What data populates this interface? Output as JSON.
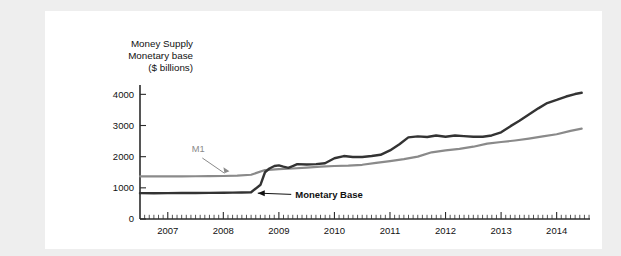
{
  "figure": {
    "background": "#ffffff",
    "page_background": "#eeeeee"
  },
  "chart_data": {
    "type": "line",
    "title": "Money Supply",
    "title_lines": [
      "Money Supply",
      "Monetary base",
      "($ billions)"
    ],
    "xlabel": "",
    "ylabel": "$ billions",
    "xlim": [
      2006.5,
      2014.6
    ],
    "ylim": [
      0,
      4300
    ],
    "yticks": [
      0,
      1000,
      2000,
      3000,
      4000
    ],
    "ytick_labels": [
      "0",
      "1000",
      "2000",
      "3000",
      "4000"
    ],
    "xticks": [
      2007,
      2008,
      2009,
      2010,
      2011,
      2012,
      2013,
      2014
    ],
    "xtick_labels": [
      "2007",
      "2008",
      "2009",
      "2010",
      "2011",
      "2012",
      "2013",
      "2014"
    ],
    "minor_tick_interval": 0.08333,
    "grid": false,
    "legend": "inline-annotations",
    "annotations": [
      {
        "text": "M1",
        "x": 2007.55,
        "y": 2150,
        "color": "#8a8a8a",
        "bold": false
      },
      {
        "text": "Monetary Base",
        "x": 2009.15,
        "y": 790,
        "color": "#111111",
        "bold": true
      }
    ],
    "series": [
      {
        "name": "M1",
        "color": "#8a8a8a",
        "width": 2.2,
        "x": [
          2006.5,
          2006.75,
          2007.0,
          2007.25,
          2007.5,
          2007.75,
          2008.0,
          2008.25,
          2008.5,
          2008.75,
          2009.0,
          2009.25,
          2009.5,
          2009.75,
          2010.0,
          2010.25,
          2010.5,
          2010.75,
          2011.0,
          2011.25,
          2011.5,
          2011.75,
          2012.0,
          2012.25,
          2012.5,
          2012.75,
          2013.0,
          2013.25,
          2013.5,
          2013.75,
          2014.0,
          2014.25,
          2014.45
        ],
        "values": [
          1370,
          1368,
          1365,
          1370,
          1372,
          1375,
          1380,
          1390,
          1420,
          1570,
          1600,
          1620,
          1650,
          1680,
          1700,
          1710,
          1740,
          1800,
          1860,
          1920,
          2000,
          2140,
          2200,
          2250,
          2320,
          2420,
          2470,
          2520,
          2580,
          2650,
          2720,
          2830,
          2900
        ]
      },
      {
        "name": "Monetary Base",
        "color": "#333333",
        "width": 2.4,
        "x": [
          2006.5,
          2006.75,
          2007.0,
          2007.25,
          2007.5,
          2007.75,
          2008.0,
          2008.17,
          2008.33,
          2008.5,
          2008.67,
          2008.75,
          2008.83,
          2008.92,
          2009.0,
          2009.08,
          2009.17,
          2009.25,
          2009.33,
          2009.5,
          2009.67,
          2009.83,
          2010.0,
          2010.17,
          2010.33,
          2010.5,
          2010.67,
          2010.83,
          2011.0,
          2011.17,
          2011.33,
          2011.5,
          2011.67,
          2011.83,
          2012.0,
          2012.17,
          2012.33,
          2012.5,
          2012.67,
          2012.83,
          2013.0,
          2013.17,
          2013.33,
          2013.5,
          2013.67,
          2013.83,
          2014.0,
          2014.17,
          2014.33,
          2014.45
        ],
        "values": [
          830,
          828,
          830,
          832,
          835,
          838,
          840,
          845,
          850,
          860,
          1100,
          1500,
          1620,
          1700,
          1720,
          1680,
          1640,
          1700,
          1760,
          1750,
          1760,
          1790,
          1950,
          2020,
          1990,
          1990,
          2020,
          2060,
          2200,
          2400,
          2620,
          2650,
          2630,
          2680,
          2640,
          2680,
          2660,
          2640,
          2640,
          2680,
          2780,
          2980,
          3150,
          3350,
          3550,
          3720,
          3820,
          3930,
          4010,
          4050
        ]
      }
    ]
  }
}
